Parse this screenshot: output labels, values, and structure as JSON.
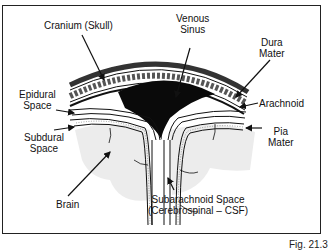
{
  "figure": {
    "caption": "Fig. 21.3",
    "labels": {
      "cranium": "Cranium (Skull)",
      "venous_line1": "Venous",
      "venous_line2": "Sinus",
      "dura_line1": "Dura",
      "dura_line2": "Mater",
      "epidural_line1": "Epidural",
      "epidural_line2": "Space",
      "arachnoid": "Arachnoid",
      "subdural_line1": "Subdural",
      "subdural_line2": "Space",
      "pia_line1": "Pia",
      "pia_line2": "Mater",
      "brain": "Brain",
      "subarachnoid_line1": "Subarachnoid Space",
      "subarachnoid_line2": "(Cerebrospinal – CSF)"
    },
    "colors": {
      "ink": "#111111",
      "brain_fill": "#eeeeee",
      "sinus_fill": "#0a0a0a"
    }
  }
}
